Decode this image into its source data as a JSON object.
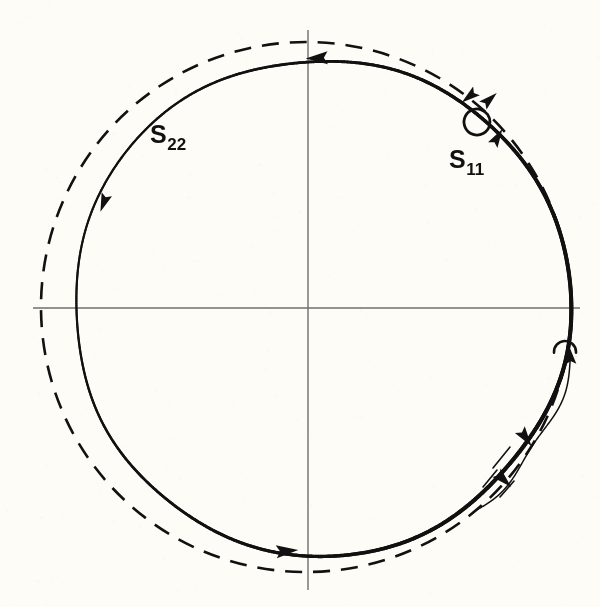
{
  "figure": {
    "background_color": "#fdfcf7",
    "ink_color": "#111111",
    "axis_color": "#6f6f6f",
    "width": 600,
    "height": 607,
    "labels": [
      {
        "id": "s22",
        "base": "S",
        "sub": "22",
        "x": 150,
        "y": 122
      },
      {
        "id": "s11",
        "base": "S",
        "sub": "11",
        "x": 449,
        "y": 147
      }
    ]
  },
  "chart_data": {
    "type": "line",
    "title": "",
    "subtitle": "",
    "xlabel": "",
    "ylabel": "",
    "grid": false,
    "legend": "none",
    "annotations": [
      {
        "text": "S22",
        "display": "S₂₂",
        "x": 150,
        "y": 122,
        "describes": "solid-trajectory-circle"
      },
      {
        "text": "S11",
        "display": "S₁₁",
        "x": 449,
        "y": 147,
        "describes": "small-loop-singularity"
      }
    ],
    "axes": {
      "horizontal": {
        "y": 308,
        "x_start": 33,
        "x_end": 580,
        "color": "#6f6f6f",
        "width": 1.4
      },
      "vertical": {
        "x": 308,
        "y_start": 30,
        "y_end": 590,
        "color": "#6f6f6f",
        "width": 1.4
      }
    },
    "series": [
      {
        "name": "S22",
        "style": "solid",
        "shape": "circle",
        "color": "#111111",
        "stroke_width": 3.1,
        "center": [
          322,
          307
        ],
        "radius": 248,
        "direction": "mixed",
        "arrow_angles_deg": [
          92,
          152,
          240,
          292,
          312,
          44,
          62
        ]
      },
      {
        "name": "outer-dashed",
        "style": "dashed",
        "shape": "circle",
        "color": "#111111",
        "stroke_width": 2.6,
        "center": [
          306,
          307
        ],
        "radius": 265,
        "dash": [
          17,
          11
        ]
      },
      {
        "name": "S11",
        "style": "solid",
        "shape": "small-loop",
        "color": "#111111",
        "stroke_width": 2.8,
        "center": [
          477,
          122
        ],
        "radius": 13
      },
      {
        "name": "right-hook",
        "style": "solid",
        "shape": "hook-with-arrow",
        "color": "#111111",
        "stroke_width": 2.6,
        "center": [
          565,
          352
        ],
        "radius": 11
      }
    ],
    "arrowheads": [
      {
        "x": 318,
        "y": 58,
        "angle_deg": 182,
        "size": 13,
        "on": "S22"
      },
      {
        "x": 104,
        "y": 202,
        "angle_deg": 250,
        "size": 11,
        "on": "S22"
      },
      {
        "x": 286,
        "y": 551,
        "angle_deg": 5,
        "size": 13,
        "on": "S22"
      },
      {
        "x": 503,
        "y": 479,
        "angle_deg": 316,
        "size": 12,
        "on": "S22"
      },
      {
        "x": 525,
        "y": 437,
        "angle_deg": 305,
        "size": 12,
        "on": "S22"
      },
      {
        "x": 497,
        "y": 138,
        "angle_deg": 59,
        "size": 11,
        "on": "S22"
      },
      {
        "x": 489,
        "y": 100,
        "angle_deg": 42,
        "size": 11,
        "on": "S22"
      },
      {
        "x": 470,
        "y": 96,
        "angle_deg": 218,
        "size": 11,
        "on": "S11-entry"
      },
      {
        "x": 570,
        "y": 356,
        "angle_deg": 96,
        "size": 11,
        "on": "right-hook"
      }
    ]
  }
}
